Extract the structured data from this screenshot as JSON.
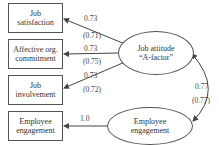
{
  "indicators": [
    {
      "label_line1": "Job",
      "label_line2": "satisfaction"
    },
    {
      "label_line1": "Affective org.",
      "label_line2": "commitment"
    },
    {
      "label_line1": "Job",
      "label_line2": "involvement"
    },
    {
      "label_line1": "Employee",
      "label_line2": "engagement"
    }
  ],
  "factors": {
    "job_attitude": {
      "line1": "Job attitude",
      "line2": "“A-factor”"
    },
    "employee_engagement": {
      "line1": "Employee",
      "line2": "engagement"
    }
  },
  "loadings": [
    {
      "value": "0.73",
      "alt": "(0.71)"
    },
    {
      "value": "0.73",
      "alt": "(0.75)"
    },
    {
      "value": "0.73",
      "alt": "(0.72)"
    },
    {
      "value": "1.0"
    }
  ],
  "correlation": {
    "value": "0.77",
    "alt": "(0.77)"
  },
  "colors": {
    "line": "#444444",
    "text": "#333333"
  }
}
